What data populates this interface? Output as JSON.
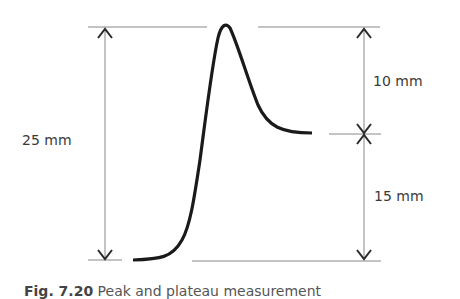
{
  "figure": {
    "labels": {
      "total_height": "25 mm",
      "upper_segment": "10 mm",
      "lower_segment": "15 mm"
    },
    "caption": {
      "number": "Fig. 7.20",
      "text": "Peak and plateau measurement"
    },
    "colors": {
      "curve": "#1a1a1a",
      "dimension_lines": "#888888",
      "arrows": "#2a2a2a",
      "text": "#3a3a3a"
    }
  }
}
